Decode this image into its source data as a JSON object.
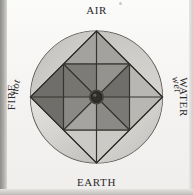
{
  "figure": {
    "elements": [
      {
        "key": "air",
        "label": "AIR",
        "position": "top"
      },
      {
        "key": "water",
        "label": "WATER",
        "position": "right"
      },
      {
        "key": "earth",
        "label": "EARTH",
        "position": "bottom"
      },
      {
        "key": "fire",
        "label": "FIRE",
        "position": "left"
      }
    ],
    "qualities": [
      {
        "key": "hot",
        "label": "hot",
        "position": "upper-left"
      },
      {
        "key": "wet",
        "label": "wet",
        "position": "upper-right"
      },
      {
        "key": "cold",
        "label": "cold",
        "position": "lower-right"
      },
      {
        "key": "dry",
        "label": "dry",
        "position": "lower-left"
      }
    ],
    "colors": {
      "ink": "#2b2b2b",
      "line": "#3a3a38",
      "circle_fill_light": "#e9e8e5",
      "circle_fill_mid": "#cfcecb",
      "diamond_dark": "#6e6d6a",
      "diamond_mid": "#8f8e8b",
      "diamond_light": "#bdbcb9",
      "inner_dark": "#5b5a57",
      "inner_mid": "#7e7d7a",
      "inner_light": "#a9a8a5",
      "hub": "#3d3c3a",
      "paper": "#f5f4f2"
    }
  }
}
